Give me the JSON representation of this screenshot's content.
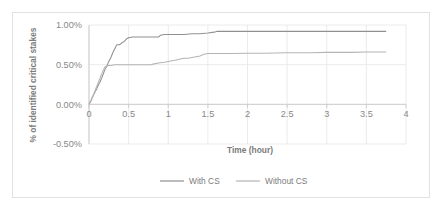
{
  "chart_data": {
    "type": "line",
    "title": "",
    "xlabel": "Time (hour)",
    "ylabel": "% of identified critical stakes",
    "xlim": [
      0,
      4
    ],
    "ylim": [
      -0.5,
      1.0
    ],
    "grid": true,
    "legend_position": "bottom",
    "x_ticks": [
      "0",
      "0.5",
      "1",
      "1.5",
      "2",
      "2.5",
      "3",
      "3.5",
      "4"
    ],
    "x_tick_values": [
      0,
      0.5,
      1,
      1.5,
      2,
      2.5,
      3,
      3.5,
      4
    ],
    "y_ticks": [
      "1.00%",
      "0.50%",
      "0.00%",
      "-0.50%"
    ],
    "y_tick_values": [
      1.0,
      0.5,
      0.0,
      -0.5
    ],
    "series": [
      {
        "name": "With CS",
        "color": "#909090",
        "points": [
          [
            0.0,
            0.0
          ],
          [
            0.02,
            0.04
          ],
          [
            0.03,
            0.05
          ],
          [
            0.04,
            0.09
          ],
          [
            0.05,
            0.1
          ],
          [
            0.06,
            0.13
          ],
          [
            0.07,
            0.14
          ],
          [
            0.08,
            0.17
          ],
          [
            0.09,
            0.18
          ],
          [
            0.1,
            0.2
          ],
          [
            0.11,
            0.23
          ],
          [
            0.12,
            0.24
          ],
          [
            0.13,
            0.27
          ],
          [
            0.14,
            0.28
          ],
          [
            0.15,
            0.31
          ],
          [
            0.16,
            0.33
          ],
          [
            0.17,
            0.36
          ],
          [
            0.18,
            0.38
          ],
          [
            0.19,
            0.41
          ],
          [
            0.2,
            0.44
          ],
          [
            0.22,
            0.47
          ],
          [
            0.24,
            0.52
          ],
          [
            0.26,
            0.56
          ],
          [
            0.28,
            0.6
          ],
          [
            0.3,
            0.65
          ],
          [
            0.32,
            0.69
          ],
          [
            0.34,
            0.73
          ],
          [
            0.35,
            0.75
          ],
          [
            0.38,
            0.75
          ],
          [
            0.4,
            0.76
          ],
          [
            0.42,
            0.78
          ],
          [
            0.44,
            0.79
          ],
          [
            0.46,
            0.81
          ],
          [
            0.48,
            0.83
          ],
          [
            0.5,
            0.84
          ],
          [
            0.55,
            0.85
          ],
          [
            0.6,
            0.85
          ],
          [
            0.7,
            0.85
          ],
          [
            0.8,
            0.85
          ],
          [
            0.88,
            0.85
          ],
          [
            0.9,
            0.87
          ],
          [
            0.95,
            0.88
          ],
          [
            1.0,
            0.88
          ],
          [
            1.1,
            0.88
          ],
          [
            1.2,
            0.88
          ],
          [
            1.3,
            0.89
          ],
          [
            1.4,
            0.89
          ],
          [
            1.5,
            0.9
          ],
          [
            1.58,
            0.91
          ],
          [
            1.62,
            0.92
          ],
          [
            1.8,
            0.92
          ],
          [
            2.0,
            0.92
          ],
          [
            2.2,
            0.92
          ],
          [
            2.5,
            0.92
          ],
          [
            2.8,
            0.92
          ],
          [
            3.0,
            0.92
          ],
          [
            3.3,
            0.92
          ],
          [
            3.5,
            0.92
          ],
          [
            3.75,
            0.92
          ]
        ]
      },
      {
        "name": "Without CS",
        "color": "#b4b4b4",
        "points": [
          [
            0.0,
            0.0
          ],
          [
            0.02,
            0.03
          ],
          [
            0.03,
            0.06
          ],
          [
            0.04,
            0.08
          ],
          [
            0.05,
            0.11
          ],
          [
            0.06,
            0.13
          ],
          [
            0.07,
            0.16
          ],
          [
            0.08,
            0.18
          ],
          [
            0.09,
            0.21
          ],
          [
            0.1,
            0.23
          ],
          [
            0.11,
            0.26
          ],
          [
            0.12,
            0.28
          ],
          [
            0.13,
            0.31
          ],
          [
            0.14,
            0.33
          ],
          [
            0.15,
            0.36
          ],
          [
            0.16,
            0.38
          ],
          [
            0.17,
            0.41
          ],
          [
            0.18,
            0.43
          ],
          [
            0.19,
            0.45
          ],
          [
            0.2,
            0.47
          ],
          [
            0.22,
            0.48
          ],
          [
            0.25,
            0.49
          ],
          [
            0.28,
            0.49
          ],
          [
            0.32,
            0.5
          ],
          [
            0.4,
            0.5
          ],
          [
            0.5,
            0.5
          ],
          [
            0.6,
            0.5
          ],
          [
            0.7,
            0.5
          ],
          [
            0.78,
            0.5
          ],
          [
            0.82,
            0.51
          ],
          [
            0.88,
            0.52
          ],
          [
            0.95,
            0.53
          ],
          [
            1.0,
            0.54
          ],
          [
            1.05,
            0.55
          ],
          [
            1.1,
            0.56
          ],
          [
            1.15,
            0.57
          ],
          [
            1.2,
            0.58
          ],
          [
            1.25,
            0.58
          ],
          [
            1.3,
            0.59
          ],
          [
            1.35,
            0.6
          ],
          [
            1.4,
            0.61
          ],
          [
            1.45,
            0.63
          ],
          [
            1.5,
            0.64
          ],
          [
            1.6,
            0.64
          ],
          [
            1.8,
            0.64
          ],
          [
            2.0,
            0.645
          ],
          [
            2.2,
            0.645
          ],
          [
            2.5,
            0.65
          ],
          [
            2.8,
            0.65
          ],
          [
            3.0,
            0.655
          ],
          [
            3.3,
            0.655
          ],
          [
            3.5,
            0.66
          ],
          [
            3.75,
            0.66
          ]
        ]
      }
    ]
  },
  "legend": {
    "items": [
      {
        "label": "With CS",
        "color": "#909090"
      },
      {
        "label": "Without CS",
        "color": "#b4b4b4"
      }
    ]
  },
  "axes": {
    "x_title": "Time (hour)",
    "y_title": "% of identified critical stakes"
  }
}
